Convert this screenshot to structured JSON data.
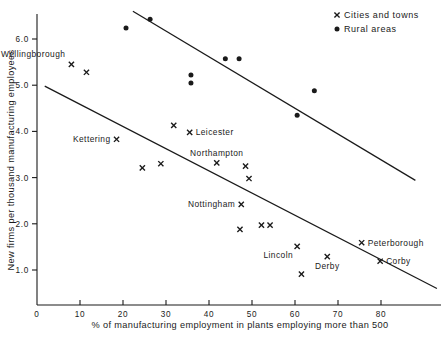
{
  "chart_data": {
    "type": "scatter",
    "title": "",
    "xlabel": "% of manufacturing employment in plants employing more than 500",
    "ylabel": "New firms per thousand manufacturing employees",
    "xlim": [
      0,
      90
    ],
    "ylim": [
      0,
      6.7
    ],
    "grid": false,
    "legend_position": "top-right",
    "xticks": [
      0,
      10,
      20,
      30,
      40,
      50,
      60,
      70,
      80
    ],
    "xtick_labels": [
      "0",
      "10",
      "20",
      "30",
      "40",
      "50",
      "60",
      "70",
      "80"
    ],
    "yticks": [
      1.0,
      2.0,
      3.0,
      4.0,
      5.0,
      6.0
    ],
    "ytick_labels": [
      "1.0",
      "2.0",
      "3.0",
      "4.0",
      "5.0",
      "6.0"
    ],
    "legend": [
      {
        "marker": "cross",
        "label": "Cities and towns"
      },
      {
        "marker": "dot",
        "label": "Rural areas"
      }
    ],
    "series": [
      {
        "name": "Cities and towns",
        "marker": "cross",
        "points": [
          {
            "x": 8.0,
            "y": 5.45,
            "label": "Wellingborough",
            "label_pos": "above-left"
          },
          {
            "x": 11.5,
            "y": 5.28,
            "label": "",
            "label_pos": ""
          },
          {
            "x": 18.5,
            "y": 3.83,
            "label": "Kettering",
            "label_pos": "left"
          },
          {
            "x": 24.5,
            "y": 3.21,
            "label": "",
            "label_pos": ""
          },
          {
            "x": 28.8,
            "y": 3.3,
            "label": "",
            "label_pos": ""
          },
          {
            "x": 31.8,
            "y": 4.13,
            "label": "",
            "label_pos": ""
          },
          {
            "x": 35.5,
            "y": 3.98,
            "label": "Leicester",
            "label_pos": "right"
          },
          {
            "x": 41.8,
            "y": 3.32,
            "label": "Northampton",
            "label_pos": "above"
          },
          {
            "x": 48.5,
            "y": 3.25,
            "label": "",
            "label_pos": ""
          },
          {
            "x": 49.3,
            "y": 2.98,
            "label": "",
            "label_pos": ""
          },
          {
            "x": 47.5,
            "y": 2.42,
            "label": "Nottingham",
            "label_pos": "left"
          },
          {
            "x": 47.2,
            "y": 1.88,
            "label": "",
            "label_pos": ""
          },
          {
            "x": 52.2,
            "y": 1.97,
            "label": "",
            "label_pos": ""
          },
          {
            "x": 54.2,
            "y": 1.97,
            "label": "",
            "label_pos": ""
          },
          {
            "x": 60.5,
            "y": 1.51,
            "label": "Lincoln",
            "label_pos": "below-left"
          },
          {
            "x": 67.5,
            "y": 1.29,
            "label": "Derby",
            "label_pos": "below"
          },
          {
            "x": 75.5,
            "y": 1.59,
            "label": "Peterborough",
            "label_pos": "right"
          },
          {
            "x": 79.8,
            "y": 1.19,
            "label": "Corby",
            "label_pos": "right"
          },
          {
            "x": 61.5,
            "y": 0.91,
            "label": "",
            "label_pos": ""
          }
        ]
      },
      {
        "name": "Rural areas",
        "marker": "dot",
        "points": [
          {
            "x": 20.7,
            "y": 6.24
          },
          {
            "x": 26.3,
            "y": 6.43
          },
          {
            "x": 35.8,
            "y": 5.22
          },
          {
            "x": 35.8,
            "y": 5.05
          },
          {
            "x": 43.8,
            "y": 5.57
          },
          {
            "x": 47.0,
            "y": 5.57
          },
          {
            "x": 64.5,
            "y": 4.88
          },
          {
            "x": 60.5,
            "y": 4.35
          }
        ]
      }
    ],
    "trend_lines": [
      {
        "name": "rural-trend",
        "x1": 22.3,
        "y1": 6.6,
        "x2": 88.0,
        "y2": 2.94
      },
      {
        "name": "urban-trend",
        "x1": 1.8,
        "y1": 4.98,
        "x2": 93.0,
        "y2": 0.6
      }
    ]
  }
}
